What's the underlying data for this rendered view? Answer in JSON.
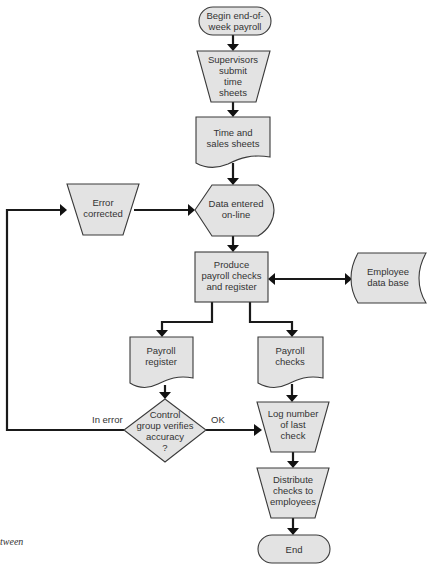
{
  "diagram": {
    "type": "flowchart",
    "nodes": {
      "begin": {
        "shape": "terminal",
        "lines": [
          "Begin end-of-",
          "week payroll"
        ]
      },
      "supervisors": {
        "shape": "manual-operation",
        "lines": [
          "Supervisors",
          "submit",
          "time",
          "sheets"
        ]
      },
      "time_sales": {
        "shape": "document",
        "lines": [
          "Time and",
          "sales sheets"
        ]
      },
      "error_corrected": {
        "shape": "manual-operation",
        "lines": [
          "Error",
          "corrected"
        ]
      },
      "data_entered": {
        "shape": "display",
        "lines": [
          "Data entered",
          "on-line"
        ]
      },
      "produce": {
        "shape": "process",
        "lines": [
          "Produce",
          "payroll checks",
          "and register"
        ]
      },
      "employee_db": {
        "shape": "stored-data",
        "lines": [
          "Employee",
          "data base"
        ]
      },
      "payroll_register": {
        "shape": "document",
        "lines": [
          "Payroll",
          "register"
        ]
      },
      "payroll_checks": {
        "shape": "document",
        "lines": [
          "Payroll",
          "checks"
        ]
      },
      "control": {
        "shape": "decision",
        "lines": [
          "Control",
          "group verifies",
          "accuracy",
          "?"
        ]
      },
      "log_number": {
        "shape": "manual-operation",
        "lines": [
          "Log number",
          "of last",
          "check"
        ]
      },
      "distribute": {
        "shape": "manual-operation",
        "lines": [
          "Distribute",
          "checks to",
          "employees"
        ]
      },
      "end": {
        "shape": "terminal",
        "lines": [
          "End"
        ]
      }
    },
    "edges": [
      {
        "from": "begin",
        "to": "supervisors"
      },
      {
        "from": "supervisors",
        "to": "time_sales"
      },
      {
        "from": "time_sales",
        "to": "data_entered"
      },
      {
        "from": "error_corrected",
        "to": "data_entered"
      },
      {
        "from": "data_entered",
        "to": "produce"
      },
      {
        "from": "produce",
        "to": "employee_db",
        "bidirectional": true
      },
      {
        "from": "produce",
        "to": "payroll_register"
      },
      {
        "from": "produce",
        "to": "payroll_checks"
      },
      {
        "from": "payroll_register",
        "to": "control"
      },
      {
        "from": "payroll_checks",
        "to": "log_number"
      },
      {
        "from": "control",
        "to": "error_corrected",
        "label": "In error"
      },
      {
        "from": "control",
        "to": "log_number",
        "label": "OK"
      },
      {
        "from": "log_number",
        "to": "distribute"
      },
      {
        "from": "distribute",
        "to": "end"
      }
    ],
    "edge_labels": {
      "in_error": "In error",
      "ok": "OK"
    },
    "caption_fragment": "tween"
  }
}
